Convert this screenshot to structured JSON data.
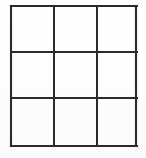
{
  "figure": {
    "background_color": "#ffffff",
    "line_color": "#2b2b2b",
    "line_width": 2,
    "rows": 3,
    "columns": 3,
    "cell_count": 9,
    "bounds": {
      "x": 11,
      "y": 6,
      "width": 126,
      "height": 141
    },
    "vertical_line_x": [
      11,
      54,
      97,
      137
    ],
    "horizontal_line_y": [
      6,
      52,
      98,
      147
    ],
    "cells": [
      {
        "id": "cell-r1-c1",
        "row": 1,
        "column": 1,
        "label": ""
      },
      {
        "id": "cell-r1-c2",
        "row": 1,
        "column": 2,
        "label": ""
      },
      {
        "id": "cell-r1-c3",
        "row": 1,
        "column": 3,
        "label": ""
      },
      {
        "id": "cell-r2-c1",
        "row": 2,
        "column": 1,
        "label": ""
      },
      {
        "id": "cell-r2-c2",
        "row": 2,
        "column": 2,
        "label": ""
      },
      {
        "id": "cell-r2-c3",
        "row": 2,
        "column": 3,
        "label": ""
      },
      {
        "id": "cell-r3-c1",
        "row": 3,
        "column": 1,
        "label": ""
      },
      {
        "id": "cell-r3-c2",
        "row": 3,
        "column": 2,
        "label": ""
      },
      {
        "id": "cell-r3-c3",
        "row": 3,
        "column": 3,
        "label": ""
      }
    ]
  }
}
